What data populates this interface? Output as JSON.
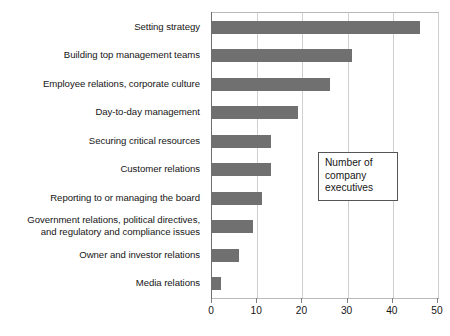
{
  "chart_data": {
    "type": "bar",
    "orientation": "horizontal",
    "title": "",
    "xlabel": "",
    "ylabel": "",
    "xlim": [
      0,
      50
    ],
    "xticks": [
      0,
      10,
      20,
      30,
      40,
      50
    ],
    "xtick_labels": [
      "0",
      "10",
      "20",
      "30",
      "40",
      "50"
    ],
    "grid": "vertical",
    "legend_position": "inside-right",
    "bar_color": "#707070",
    "categories": [
      "Setting strategy",
      "Building top management teams",
      "Employee relations, corporate culture",
      "Day-to-day management",
      "Securing critical resources",
      "Customer relations",
      "Reporting to or managing the board",
      "Government relations, political directives,\nand regulatory and compliance issues",
      "Owner and investor relations",
      "Media relations"
    ],
    "values": [
      46,
      31,
      26,
      19,
      13,
      13,
      11,
      9,
      6,
      2
    ],
    "annotation": {
      "lines": [
        "Number of",
        "company",
        "executives"
      ]
    }
  }
}
